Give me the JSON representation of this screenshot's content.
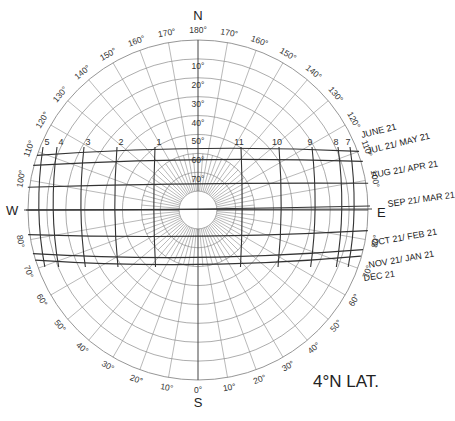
{
  "title": "4°N LAT.",
  "chart_data": {
    "type": "sun-path-diagram",
    "latitude": "4°N",
    "projection": "polar (equidistant altitude rings)",
    "cardinal_points": {
      "N": "N",
      "S": "S",
      "E": "E",
      "W": "W"
    },
    "bearing_labels_top": [
      "180°",
      "170°",
      "160°",
      "150°",
      "140°",
      "130°",
      "120°",
      "110°",
      "100°"
    ],
    "bearing_labels_bottom": [
      "0°",
      "10°",
      "20°",
      "30°",
      "40°",
      "50°",
      "60°",
      "70°",
      "80°"
    ],
    "altitude_labels": [
      "10°",
      "20°",
      "30°",
      "40°",
      "50°",
      "60°",
      "70°"
    ],
    "altitude_rings_deg": [
      0,
      10,
      20,
      30,
      40,
      50,
      60,
      70,
      80
    ],
    "hour_labels": {
      "morning": [
        "5",
        "4",
        "3",
        "2",
        "1"
      ],
      "afternoon": [
        "11",
        "10",
        "9",
        "8",
        "7"
      ]
    },
    "date_lines": [
      {
        "label": "JUNE 21",
        "y_offset": -60
      },
      {
        "label": "JUL 21/ MAY  21",
        "y_offset": -49
      },
      {
        "label": "AUG 21/ APR 21",
        "y_offset": -25
      },
      {
        "label": "SEP 21/ MAR 21",
        "y_offset": 0
      },
      {
        "label": "OCT 21/ FEB 21",
        "y_offset": 27
      },
      {
        "label": "NOV 21/ JAN 21",
        "y_offset": 48
      },
      {
        "label": "DEC 21",
        "y_offset": 55
      }
    ]
  },
  "labels": {
    "north": "N",
    "south": "S",
    "east": "E",
    "west": "W",
    "june": "JUNE 21",
    "jul_may": "JUL 21/ MAY  21",
    "aug_apr": "AUG 21/ APR 21",
    "sep_mar": "SEP 21/ MAR 21",
    "oct_feb": "OCT 21/ FEB 21",
    "nov_jan": "NOV 21/ JAN 21",
    "dec": "DEC 21",
    "latitude": "4°N LAT."
  }
}
